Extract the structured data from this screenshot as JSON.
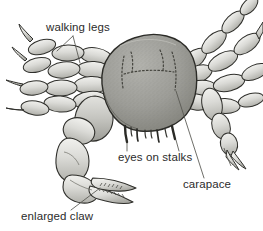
{
  "figure": {
    "background_color": "#ffffff",
    "ink_color": "#2b2b2b",
    "shell_fill_color": "#9a9a96",
    "limb_fill_color": "#d8d8d4",
    "width": 263,
    "height": 231
  },
  "labels": {
    "walking_legs": "walking legs",
    "eyes_on_stalks": "eyes on stalks",
    "carapace": "carapace",
    "enlarged_claw": "enlarged claw"
  },
  "parts": {
    "carapace": "carapace-body",
    "eye_stalks": "eye-stalks",
    "mouthparts": "mouthparts",
    "left_walking_legs": "left-walking-legs",
    "right_walking_legs": "right-walking-legs",
    "enlarged_claw": "enlarged-claw-cheliped",
    "small_claw": "small-claw-cheliped"
  }
}
